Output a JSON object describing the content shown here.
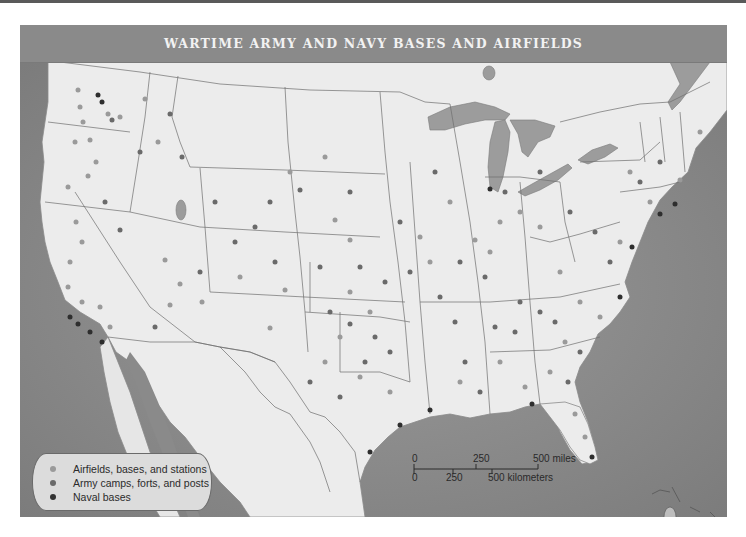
{
  "title": "WARTIME ARMY AND NAVY BASES AND AIRFIELDS",
  "colors": {
    "airfield": "#9a9a9a",
    "army": "#6a6a6a",
    "naval": "#2e2e2e",
    "land": "#ebebeb",
    "water": "#8c8c8c",
    "lakes": "#9a9a9a",
    "title_bar": "#8a8a8a"
  },
  "legend": {
    "items": [
      {
        "label": "Airfields, bases, and stations",
        "icon": "gray-dot-icon"
      },
      {
        "label": "Army camps, forts, and posts",
        "icon": "dark-gray-dot-icon"
      },
      {
        "label": "Naval bases",
        "icon": "black-dot-icon"
      }
    ]
  },
  "scale_bar": {
    "miles_ticks": [
      "0",
      "250",
      "500 miles"
    ],
    "km_ticks": [
      "0",
      "250",
      "500 kilometers"
    ]
  }
}
